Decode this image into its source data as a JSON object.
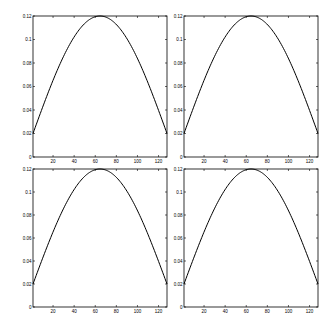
{
  "figure": {
    "layout": "2x2 grid of subplots",
    "background": "#ffffff",
    "line_color": "#000000"
  },
  "chart_data": [
    {
      "type": "line",
      "position": "top-left",
      "title": "",
      "xlabel": "",
      "ylabel": "",
      "xlim": [
        1,
        128
      ],
      "ylim": [
        0,
        0.12
      ],
      "xticks": [
        20,
        40,
        60,
        80,
        100,
        120
      ],
      "yticks": [
        0,
        0.02,
        0.04,
        0.06,
        0.08,
        0.1,
        0.12
      ],
      "xtick_labels": [
        "20",
        "40",
        "60",
        "80",
        "100",
        "120"
      ],
      "ytick_labels": [
        "0",
        "0.02",
        "0.04",
        "0.06",
        "0.08",
        "0.1",
        "0.12"
      ],
      "grid": false,
      "legend": null,
      "series": [
        {
          "name": "curve",
          "description": "half-sine window, 0.02 at edges, 0.12 peak near x=64",
          "x": [
            1,
            10,
            20,
            30,
            40,
            50,
            60,
            64,
            70,
            80,
            90,
            100,
            110,
            120,
            128
          ],
          "y": [
            0.02,
            0.042,
            0.065,
            0.085,
            0.101,
            0.113,
            0.119,
            0.12,
            0.118,
            0.11,
            0.097,
            0.079,
            0.058,
            0.036,
            0.02
          ]
        }
      ]
    },
    {
      "type": "line",
      "position": "top-right",
      "title": "",
      "xlabel": "",
      "ylabel": "",
      "xlim": [
        1,
        128
      ],
      "ylim": [
        0,
        0.12
      ],
      "xticks": [
        20,
        40,
        60,
        80,
        100,
        120
      ],
      "yticks": [
        0,
        0.02,
        0.04,
        0.06,
        0.08,
        0.1,
        0.12
      ],
      "xtick_labels": [
        "20",
        "40",
        "60",
        "80",
        "100",
        "120"
      ],
      "ytick_labels": [
        "0",
        "0.02",
        "0.04",
        "0.06",
        "0.08",
        "0.1",
        "0.12"
      ],
      "grid": false,
      "legend": null,
      "series": [
        {
          "name": "curve",
          "description": "half-sine window, 0.02 at edges, 0.12 peak near x=64",
          "x": [
            1,
            10,
            20,
            30,
            40,
            50,
            60,
            64,
            70,
            80,
            90,
            100,
            110,
            120,
            128
          ],
          "y": [
            0.02,
            0.042,
            0.065,
            0.085,
            0.101,
            0.113,
            0.119,
            0.12,
            0.118,
            0.11,
            0.097,
            0.079,
            0.058,
            0.036,
            0.02
          ]
        }
      ]
    },
    {
      "type": "line",
      "position": "bottom-left",
      "title": "",
      "xlabel": "",
      "ylabel": "",
      "xlim": [
        1,
        128
      ],
      "ylim": [
        0,
        0.12
      ],
      "xticks": [
        20,
        40,
        60,
        80,
        100,
        120
      ],
      "yticks": [
        0,
        0.02,
        0.04,
        0.06,
        0.08,
        0.1,
        0.12
      ],
      "xtick_labels": [
        "20",
        "40",
        "60",
        "80",
        "100",
        "120"
      ],
      "ytick_labels": [
        "0",
        "0.02",
        "0.04",
        "0.06",
        "0.08",
        "0.1",
        "0.12"
      ],
      "grid": false,
      "legend": null,
      "series": [
        {
          "name": "curve",
          "description": "half-sine window, 0.02 at edges, 0.12 peak near x=64",
          "x": [
            1,
            10,
            20,
            30,
            40,
            50,
            60,
            64,
            70,
            80,
            90,
            100,
            110,
            120,
            128
          ],
          "y": [
            0.02,
            0.042,
            0.065,
            0.085,
            0.101,
            0.113,
            0.119,
            0.12,
            0.118,
            0.11,
            0.097,
            0.079,
            0.058,
            0.036,
            0.02
          ]
        }
      ]
    },
    {
      "type": "line",
      "position": "bottom-right",
      "title": "",
      "xlabel": "",
      "ylabel": "",
      "xlim": [
        1,
        128
      ],
      "ylim": [
        0,
        0.12
      ],
      "xticks": [
        20,
        40,
        60,
        80,
        100,
        120
      ],
      "yticks": [
        0,
        0.02,
        0.04,
        0.06,
        0.08,
        0.1,
        0.12
      ],
      "xtick_labels": [
        "20",
        "40",
        "60",
        "80",
        "100",
        "120"
      ],
      "ytick_labels": [
        "0",
        "0.02",
        "0.04",
        "0.06",
        "0.08",
        "0.1",
        "0.12"
      ],
      "grid": false,
      "legend": null,
      "series": [
        {
          "name": "curve",
          "description": "half-sine window, 0.02 at edges, 0.12 peak near x=64",
          "x": [
            1,
            10,
            20,
            30,
            40,
            50,
            60,
            64,
            70,
            80,
            90,
            100,
            110,
            120,
            128
          ],
          "y": [
            0.02,
            0.042,
            0.065,
            0.085,
            0.101,
            0.113,
            0.119,
            0.12,
            0.118,
            0.11,
            0.097,
            0.079,
            0.058,
            0.036,
            0.02
          ]
        }
      ]
    }
  ]
}
